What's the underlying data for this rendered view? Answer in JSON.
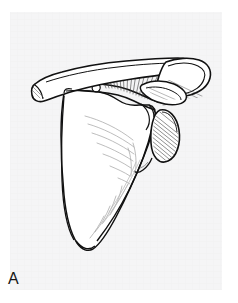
{
  "figure": {
    "label": "A",
    "caption_text": "A",
    "domain": "anatomical-line-drawing",
    "background_color": "#ffffff",
    "panel_color": "#f4f4f5",
    "ink_color": "#111111",
    "hatch_color": "#3a3a3a",
    "faint_line_color": "#9a9a9a",
    "canvas": {
      "width": 238,
      "height": 303
    },
    "panel": {
      "x": 10,
      "y": 12,
      "width": 212,
      "height": 278
    },
    "label_position": {
      "x": 8,
      "y": 269
    }
  },
  "structures": [
    {
      "name": "clavicle",
      "description": "Long S-curved bone running from upper-left to upper-right across the top of the figure",
      "shaded": false
    },
    {
      "name": "clavicle-sternal-end",
      "description": "Flared medial tip of clavicle at left edge of drawing",
      "shaded": true
    },
    {
      "name": "acromion",
      "description": "Flat lateral process overlapping the clavicle at upper right",
      "shaded": true
    },
    {
      "name": "coracoid-process",
      "description": "Hook-shaped process beneath the clavicle near the center right",
      "shaded": true
    },
    {
      "name": "spine-of-scapula",
      "description": "Ridge running obliquely with fan of radiating hatch lines in supraspinous region",
      "shaded": true
    },
    {
      "name": "supraspinous-fossa",
      "description": "Shallow area above the scapular spine with fine radiating lines",
      "shaded": true
    },
    {
      "name": "infraspinous-fossa",
      "description": "Large triangular body of the scapula below the spine with faint muscle lines",
      "shaded": false
    },
    {
      "name": "glenoid-cavity",
      "description": "Oval hatched depression at the lateral angle, right side of figure",
      "shaded": true
    },
    {
      "name": "medial-border",
      "description": "Long straight border descending on the left side of the scapular body",
      "shaded": false
    },
    {
      "name": "lateral-border",
      "description": "Border descending from the glenoid toward the inferior angle",
      "shaded": false
    },
    {
      "name": "inferior-angle",
      "description": "Rounded bottom apex of the scapula",
      "shaded": false
    }
  ]
}
